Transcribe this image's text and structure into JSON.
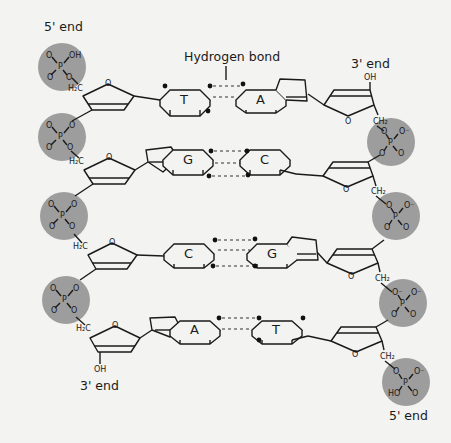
{
  "labels": {
    "hydrogen_bond": "Hydrogen bond",
    "left_top_end": "5' end",
    "right_top_end": "3' end",
    "left_bottom_end": "3' end",
    "right_bottom_end": "5' end"
  },
  "colors": {
    "background": "#f3f3f1",
    "phosphate_fill": "#9d9d9d",
    "line": "#1a1a1a"
  },
  "base_pairs": [
    {
      "left": "T",
      "right": "A",
      "hydrogen_bonds": 2
    },
    {
      "left": "G",
      "right": "C",
      "hydrogen_bonds": 3
    },
    {
      "left": "C",
      "right": "G",
      "hydrogen_bonds": 3
    },
    {
      "left": "A",
      "right": "T",
      "hydrogen_bonds": 2
    }
  ],
  "atoms": {
    "phosphorus": "P",
    "oxygen": "O",
    "oxygen_minus": "O⁻",
    "hydroxyl": "OH",
    "hydroxyl_left": "HO",
    "ch2_left": "H₂C",
    "ch2_right": "CH₂"
  },
  "strands": {
    "left": {
      "direction": "5' to 3'",
      "phosphate_groups": 4
    },
    "right": {
      "direction": "3' to 5'",
      "phosphate_groups": 4
    }
  }
}
